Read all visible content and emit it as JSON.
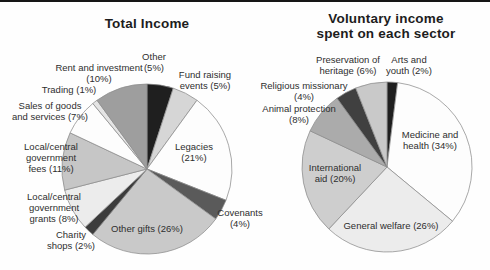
{
  "style": {
    "background": "#fefefe",
    "top_rule_color": "#161616",
    "slice_stroke": "#8c8c8c",
    "text_color": "#2e2e2e",
    "title_color": "#1d1d1d"
  },
  "chart_data": [
    {
      "type": "pie",
      "title": "Total Income",
      "legend": "none (direct labels)",
      "start_angle_deg": 0,
      "direction": "clockwise",
      "cx": 147,
      "cy": 169,
      "r": 85,
      "categories": [
        "Other",
        "Fund raising events",
        "Legacies",
        "Covenants",
        "Other gifts",
        "Charity shops",
        "Local/central government grants",
        "Local/central government fees",
        "Sales of goods and services",
        "Trading",
        "Rent and investment"
      ],
      "values": [
        5,
        5,
        21,
        4,
        26,
        2,
        8,
        11,
        7,
        1,
        10
      ],
      "slices": [
        {
          "id": "other",
          "name": "Other",
          "value": 5,
          "color": "#1f1f1f",
          "label": "Other\n(5%)"
        },
        {
          "id": "fund-raising-events",
          "name": "Fund raising events",
          "value": 5,
          "color": "#d6d6d6",
          "label": "Fund raising\nevents (5%)"
        },
        {
          "id": "legacies",
          "name": "Legacies",
          "value": 21,
          "color": "#fdfdfd",
          "label": "Legacies\n(21%)"
        },
        {
          "id": "covenants",
          "name": "Covenants",
          "value": 4,
          "color": "#5a5a5a",
          "label": "Covenants\n(4%)"
        },
        {
          "id": "other-gifts",
          "name": "Other gifts",
          "value": 26,
          "color": "#c9c9c9",
          "label": "Other gifts (26%)"
        },
        {
          "id": "charity-shops",
          "name": "Charity shops",
          "value": 2,
          "color": "#3c3c3c",
          "label": "Charity\nshops (2%)"
        },
        {
          "id": "government-grants",
          "name": "Local/central government grants",
          "value": 8,
          "color": "#ececec",
          "label": "Local/central\ngovernment\ngrants (8%)"
        },
        {
          "id": "government-fees",
          "name": "Local/central government fees",
          "value": 11,
          "color": "#c6c6c6",
          "label": "Local/central\ngovernment\nfees (11%)"
        },
        {
          "id": "sales-goods-services",
          "name": "Sales of goods and services",
          "value": 7,
          "color": "#fdfdfd",
          "label": "Sales of goods\nand services (7%)"
        },
        {
          "id": "trading",
          "name": "Trading",
          "value": 1,
          "color": "#e4e4e4",
          "label": "Trading (1%)"
        },
        {
          "id": "rent-investment",
          "name": "Rent and investment",
          "value": 10,
          "color": "#9e9e9e",
          "label": "Rent and investment\n(10%)"
        }
      ]
    },
    {
      "type": "pie",
      "title": "Voluntary income spent on each sector",
      "legend": "none (direct labels)",
      "start_angle_deg": 0,
      "direction": "clockwise",
      "cx": 387,
      "cy": 167,
      "r": 85,
      "categories": [
        "Arts and youth",
        "Medicine and health",
        "General welfare",
        "International aid",
        "Animal protection",
        "Religious missionary",
        "Preservation of heritage"
      ],
      "values": [
        2,
        34,
        26,
        20,
        8,
        4,
        6
      ],
      "slices": [
        {
          "id": "arts-youth",
          "name": "Arts and youth",
          "value": 2,
          "color": "#1f1f1f",
          "label": "Arts and\nyouth (2%)"
        },
        {
          "id": "medicine-health",
          "name": "Medicine and health",
          "value": 34,
          "color": "#fdfdfd",
          "label": "Medicine and\nhealth (34%)"
        },
        {
          "id": "general-welfare",
          "name": "General welfare",
          "value": 26,
          "color": "#ececec",
          "label": "General welfare (26%)"
        },
        {
          "id": "international-aid",
          "name": "International aid",
          "value": 20,
          "color": "#cecece",
          "label": "International\naid (20%)"
        },
        {
          "id": "animal-protection",
          "name": "Animal protection",
          "value": 8,
          "color": "#ababab",
          "label": "Animal protection\n(8%)"
        },
        {
          "id": "religious-missionary",
          "name": "Religious missionary",
          "value": 4,
          "color": "#404040",
          "label": "Religious missionary\n(4%)"
        },
        {
          "id": "preservation-heritage",
          "name": "Preservation of heritage",
          "value": 6,
          "color": "#c9c9c9",
          "label": "Preservation of\nheritage (6%)"
        }
      ]
    }
  ]
}
